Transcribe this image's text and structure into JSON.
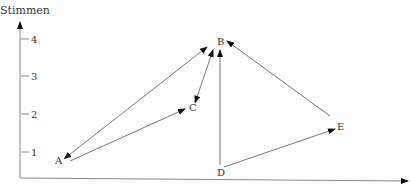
{
  "y_axis": {
    "label": "Stimmen",
    "ticks": [
      {
        "label": "4",
        "y": 39
      },
      {
        "label": "3",
        "y": 76
      },
      {
        "label": "2",
        "y": 114
      },
      {
        "label": "1",
        "y": 152
      }
    ]
  },
  "nodes": {
    "A": "A",
    "B": "B",
    "C": "C",
    "D": "D",
    "E": "E"
  }
}
